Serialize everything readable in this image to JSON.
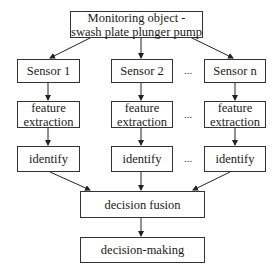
{
  "diagram": {
    "top": {
      "label": "Monitoring object - swash plate plunger pump"
    },
    "columns": [
      {
        "sensor": "Sensor 1",
        "feature": "feature extraction",
        "identify": "identify"
      },
      {
        "sensor": "Sensor 2",
        "feature": "feature extraction",
        "identify": "identify"
      },
      {
        "sensor": "Sensor n",
        "feature": "feature extraction",
        "identify": "identify"
      }
    ],
    "ellipsis": "...",
    "fusion": {
      "label": "decision fusion"
    },
    "decision": {
      "label": "decision-making"
    }
  }
}
